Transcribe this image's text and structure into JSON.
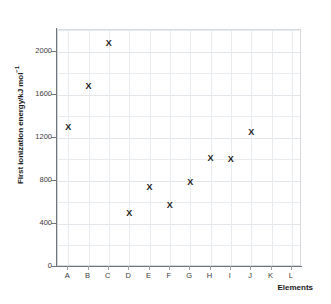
{
  "chart_data": {
    "type": "scatter",
    "title": "",
    "xlabel": "Elements",
    "ylabel": "First ionization energy/kJ mol",
    "ylabel_superscript": "−1",
    "ylabel_full": "First ionization energy/kJ mol⁻¹",
    "categories": [
      "A",
      "B",
      "C",
      "D",
      "E",
      "F",
      "G",
      "H",
      "I",
      "J",
      "K",
      "L"
    ],
    "values": [
      1300,
      1680,
      2080,
      500,
      740,
      580,
      790,
      1010,
      1000,
      1250,
      null,
      null
    ],
    "points": [
      {
        "x": "A",
        "y": 1300
      },
      {
        "x": "B",
        "y": 1680
      },
      {
        "x": "C",
        "y": 2080
      },
      {
        "x": "D",
        "y": 500
      },
      {
        "x": "E",
        "y": 740
      },
      {
        "x": "F",
        "y": 580
      },
      {
        "x": "G",
        "y": 790
      },
      {
        "x": "H",
        "y": 1010
      },
      {
        "x": "I",
        "y": 1000
      },
      {
        "x": "J",
        "y": 1250
      },
      {
        "x": "K",
        "y": null
      },
      {
        "x": "L",
        "y": null
      }
    ],
    "marker_symbol": "X",
    "marker_color": "#1b1b1b",
    "ylim": [
      0,
      2200
    ],
    "ytick_labels": [
      "0",
      "400",
      "800",
      "1200",
      "1600",
      "2000"
    ],
    "ytick_values": [
      0,
      400,
      800,
      1200,
      1600,
      2000
    ],
    "ygrid_values": [
      200,
      400,
      600,
      800,
      1000,
      1200,
      1400,
      1600,
      1800,
      2000,
      2200
    ],
    "grid": true,
    "grid_color": "#e9ecef",
    "legend": false,
    "background_color": "#ffffff",
    "axis_color": "#6e7478"
  }
}
